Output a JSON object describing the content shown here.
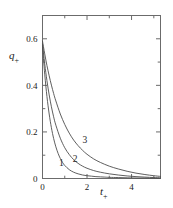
{
  "chart_data": {
    "type": "line",
    "title": "",
    "subtitle": "",
    "xlabel": "t",
    "xlabel_sub": "+",
    "ylabel": "q",
    "ylabel_sub": "+",
    "xlim": [
      0,
      5.3
    ],
    "ylim": [
      0,
      0.7
    ],
    "grid": false,
    "legend": "inline-curve-labels",
    "frame": "box",
    "x_ticks_major": [
      0,
      2,
      4
    ],
    "x_tick_labels": [
      "0",
      "2",
      "4"
    ],
    "x_ticks_minor": [
      1,
      3,
      5
    ],
    "y_ticks_major": [
      0,
      0.2,
      0.4,
      0.6
    ],
    "y_tick_labels": [
      "0",
      "0.2",
      "0.4",
      "0.6"
    ],
    "y_ticks_minor": [
      0.1,
      0.3,
      0.5,
      0.7
    ],
    "series": [
      {
        "name": "1",
        "label": "1",
        "label_x": 0.85,
        "label_y": 0.055,
        "color": "#4d4d4d",
        "x": [
          0.0,
          0.1,
          0.2,
          0.3,
          0.4,
          0.5,
          0.6,
          0.7,
          0.8,
          0.9,
          1.0,
          1.2,
          1.4,
          1.6,
          1.8,
          2.0,
          2.2,
          2.4,
          2.6,
          2.8,
          3.0,
          3.4,
          3.8,
          4.2,
          4.6,
          5.0,
          5.3
        ],
        "y": [
          0.57,
          0.448,
          0.352,
          0.277,
          0.218,
          0.172,
          0.136,
          0.108,
          0.086,
          0.069,
          0.056,
          0.038,
          0.027,
          0.02,
          0.015,
          0.012,
          0.01,
          0.008,
          0.007,
          0.006,
          0.005,
          0.004,
          0.003,
          0.002,
          0.002,
          0.001,
          0.001
        ]
      },
      {
        "name": "2",
        "label": "2",
        "label_x": 1.46,
        "label_y": 0.072,
        "color": "#4d4d4d",
        "x": [
          0.0,
          0.1,
          0.2,
          0.3,
          0.4,
          0.5,
          0.6,
          0.8,
          1.0,
          1.2,
          1.4,
          1.6,
          1.8,
          2.0,
          2.3,
          2.6,
          3.0,
          3.4,
          3.8,
          4.2,
          4.6,
          5.0,
          5.3
        ],
        "y": [
          0.578,
          0.492,
          0.42,
          0.359,
          0.308,
          0.265,
          0.229,
          0.173,
          0.132,
          0.103,
          0.081,
          0.065,
          0.053,
          0.044,
          0.034,
          0.027,
          0.02,
          0.015,
          0.011,
          0.008,
          0.006,
          0.004,
          0.003
        ]
      },
      {
        "name": "3",
        "label": "3",
        "label_x": 1.9,
        "label_y": 0.152,
        "color": "#4d4d4d",
        "x": [
          0.0,
          0.1,
          0.2,
          0.3,
          0.4,
          0.5,
          0.6,
          0.8,
          1.0,
          1.2,
          1.4,
          1.6,
          1.8,
          2.0,
          2.3,
          2.6,
          3.0,
          3.4,
          3.8,
          4.2,
          4.6,
          5.0,
          5.3
        ],
        "y": [
          0.59,
          0.535,
          0.485,
          0.441,
          0.401,
          0.365,
          0.333,
          0.277,
          0.232,
          0.195,
          0.165,
          0.141,
          0.121,
          0.104,
          0.084,
          0.069,
          0.053,
          0.041,
          0.031,
          0.023,
          0.017,
          0.012,
          0.009
        ]
      }
    ]
  },
  "axis": {
    "y_title_main": "q",
    "y_title_sub": "+",
    "x_title_main": "t",
    "x_title_sub": "+"
  },
  "style": {
    "frame_color": "#6b6b6b",
    "curve_color": "#4d4d4d",
    "text_color": "#1a1a1a",
    "background": "#ffffff"
  }
}
